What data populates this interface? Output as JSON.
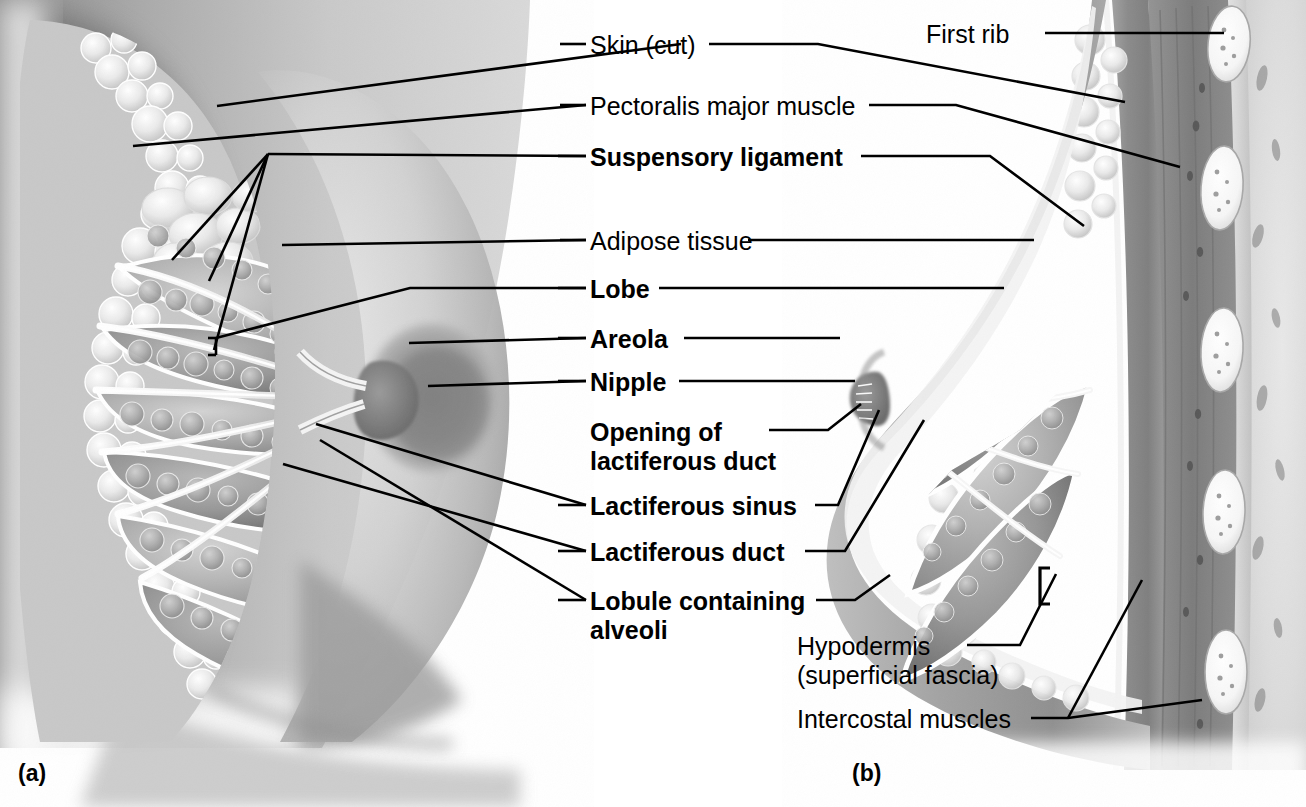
{
  "figure": {
    "background_color": "#ffffff",
    "line_color": "#000000",
    "text_color": "#000000"
  },
  "panels": [
    {
      "id": "a",
      "letter": "(a)",
      "view": "anterior view, partial sagittal section of the breast",
      "x": 18,
      "y": 760
    },
    {
      "id": "b",
      "letter": "(b)",
      "view": "sagittal section of the breast and chest wall",
      "x": 852,
      "y": 760
    }
  ],
  "labels": [
    {
      "id": "skin-cut",
      "text": "Skin (cut)",
      "bold": false,
      "x": 590,
      "y": 31,
      "align": "left",
      "lines": [
        [
          [
            560,
            44
          ],
          [
            586,
            44
          ]
        ],
        [
          [
            681,
            44
          ],
          [
            217,
            106
          ]
        ],
        [
          [
            709,
            44
          ],
          [
            818,
            44
          ],
          [
            1125,
            102
          ]
        ]
      ]
    },
    {
      "id": "pectoralis-major-muscle",
      "text": "Pectoralis major muscle",
      "bold": false,
      "x": 590,
      "y": 92,
      "align": "left",
      "lines": [
        [
          [
            560,
            105
          ],
          [
            586,
            105
          ]
        ],
        [
          [
            869,
            105
          ],
          [
            956,
            105
          ],
          [
            1180,
            167
          ]
        ],
        [
          [
            586,
            105
          ],
          [
            133,
            146
          ]
        ]
      ]
    },
    {
      "id": "suspensory-ligament",
      "text": "Suspensory ligament",
      "bold": true,
      "x": 590,
      "y": 143,
      "align": "left",
      "lines": [
        [
          [
            558,
            156
          ],
          [
            586,
            156
          ]
        ],
        [
          [
            861,
            156
          ],
          [
            990,
            156
          ],
          [
            1084,
            226
          ]
        ],
        [
          [
            586,
            156
          ],
          [
            268,
            154
          ]
        ],
        [
          [
            268,
            154
          ],
          [
            172,
            260
          ]
        ],
        [
          [
            268,
            154
          ],
          [
            209,
            281
          ]
        ],
        [
          [
            268,
            154
          ],
          [
            214,
            350
          ]
        ]
      ]
    },
    {
      "id": "adipose-tissue",
      "text": "Adipose tissue",
      "bold": false,
      "x": 590,
      "y": 227,
      "align": "left",
      "lines": [
        [
          [
            560,
            240
          ],
          [
            586,
            240
          ]
        ],
        [
          [
            748,
            240
          ],
          [
            1034,
            240
          ]
        ],
        [
          [
            586,
            240
          ],
          [
            282,
            245
          ]
        ]
      ]
    },
    {
      "id": "lobe",
      "text": "Lobe",
      "bold": true,
      "x": 590,
      "y": 275,
      "align": "left",
      "lines": [
        [
          [
            558,
            288
          ],
          [
            586,
            288
          ]
        ],
        [
          [
            659,
            288
          ],
          [
            1004,
            288
          ]
        ],
        [
          [
            586,
            288
          ],
          [
            410,
            288
          ],
          [
            216,
            338
          ]
        ],
        [
          [
            216,
            338
          ],
          [
            216,
            355
          ]
        ],
        [
          [
            216,
            338
          ],
          [
            208,
            338
          ]
        ],
        [
          [
            216,
            355
          ],
          [
            208,
            355
          ]
        ]
      ]
    },
    {
      "id": "areola",
      "text": "Areola",
      "bold": true,
      "x": 590,
      "y": 325,
      "align": "left",
      "lines": [
        [
          [
            558,
            338
          ],
          [
            586,
            338
          ]
        ],
        [
          [
            684,
            338
          ],
          [
            840,
            338
          ]
        ],
        [
          [
            586,
            338
          ],
          [
            409,
            343
          ]
        ]
      ]
    },
    {
      "id": "nipple",
      "text": "Nipple",
      "bold": true,
      "x": 590,
      "y": 368,
      "align": "left",
      "lines": [
        [
          [
            558,
            381
          ],
          [
            586,
            381
          ]
        ],
        [
          [
            679,
            381
          ],
          [
            855,
            381
          ]
        ],
        [
          [
            586,
            381
          ],
          [
            428,
            386
          ]
        ]
      ]
    },
    {
      "id": "opening-of-lactiferous-duct",
      "text": "Opening of\nlactiferous duct",
      "bold": true,
      "x": 590,
      "y": 418,
      "align": "left",
      "lines": [
        [
          [
            769,
            430
          ],
          [
            828,
            430
          ],
          [
            861,
            404
          ]
        ]
      ]
    },
    {
      "id": "lactiferous-sinus",
      "text": "Lactiferous sinus",
      "bold": true,
      "x": 590,
      "y": 492,
      "align": "left",
      "lines": [
        [
          [
            558,
            505
          ],
          [
            586,
            505
          ]
        ],
        [
          [
            815,
            505
          ],
          [
            838,
            505
          ],
          [
            879,
            410
          ]
        ],
        [
          [
            586,
            505
          ],
          [
            316,
            424
          ]
        ]
      ]
    },
    {
      "id": "lactiferous-duct",
      "text": "Lactiferous duct",
      "bold": true,
      "x": 590,
      "y": 538,
      "align": "left",
      "lines": [
        [
          [
            558,
            551
          ],
          [
            586,
            551
          ]
        ],
        [
          [
            805,
            551
          ],
          [
            845,
            551
          ],
          [
            924,
            420
          ]
        ],
        [
          [
            586,
            551
          ],
          [
            283,
            464
          ]
        ]
      ]
    },
    {
      "id": "lobule-containing-alveoli",
      "text": "Lobule containing\nalveoli",
      "bold": true,
      "x": 590,
      "y": 587,
      "align": "left",
      "lines": [
        [
          [
            558,
            600
          ],
          [
            586,
            600
          ]
        ],
        [
          [
            816,
            600
          ],
          [
            855,
            600
          ],
          [
            890,
            575
          ]
        ],
        [
          [
            586,
            600
          ],
          [
            320,
            440
          ]
        ]
      ]
    },
    {
      "id": "first-rib",
      "text": "First rib",
      "bold": false,
      "x": 926,
      "y": 20,
      "align": "left",
      "lines": [
        [
          [
            1045,
            33
          ],
          [
            1224,
            33
          ]
        ]
      ]
    },
    {
      "id": "hypodermis-superficial-fascia",
      "text": "Hypodermis\n(superficial fascia)",
      "bold": false,
      "x": 797,
      "y": 632,
      "align": "left",
      "lines": [
        [
          [
            967,
            645
          ],
          [
            1020,
            645
          ],
          [
            1056,
            574
          ]
        ]
      ]
    },
    {
      "id": "intercostal-muscles",
      "text": "Intercostal muscles",
      "bold": false,
      "x": 797,
      "y": 705,
      "align": "left",
      "lines": [
        [
          [
            1031,
            718
          ],
          [
            1068,
            718
          ],
          [
            1202,
            700
          ]
        ],
        [
          [
            1068,
            718
          ],
          [
            1142,
            580
          ]
        ]
      ]
    }
  ],
  "illustration_notes": {
    "panel_a": "Grayscale airbrushed anterior-oblique view of a breast with anterior dissection revealing adipose lobules, glandular lobes, lactiferous ducts converging on the nipple, and areola.",
    "panel_b": "Grayscale sagittal section through breast and anterior chest wall showing skin, hypodermis, adipose tissue, glandular lobes, lactiferous ducts and sinuses, pectoralis major, ribs in cross-section and intercostal muscles."
  }
}
